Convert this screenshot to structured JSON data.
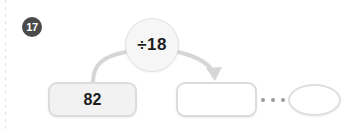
{
  "page": {
    "background_color": "#ffffff",
    "width": 354,
    "height": 131
  },
  "question": {
    "number_badge": "17",
    "badge_color": "#4a4a4a",
    "badge_text_color": "#ffffff"
  },
  "function_machine": {
    "operator": {
      "label": "÷18",
      "icon": "divide-by-circle",
      "fill": "#f6f6f6",
      "border": "#e2e2e2"
    },
    "input": {
      "value": "82",
      "fill": "#f2f2f2",
      "border": "#dcdcdc"
    },
    "output": {
      "value": "",
      "placeholder": "",
      "fill": "#ffffff",
      "border": "#dcdcdc"
    },
    "continuation": {
      "ellipsis": "•••",
      "dot_color": "#9a9a9a"
    },
    "final_shape": {
      "value": "",
      "shape": "oval",
      "fill": "#ffffff",
      "border": "#dedede"
    },
    "arrows": {
      "in_arrow_name": "input-to-operator-curve",
      "out_arrow_name": "operator-to-output-arrow",
      "stroke_color": "#d5d5d5"
    }
  }
}
